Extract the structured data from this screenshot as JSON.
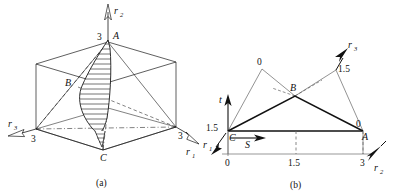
{
  "figure": {
    "panels": [
      {
        "id": "a",
        "caption": "(a)",
        "description": "Cube with hatched lens-shaped surface through points A, B, C",
        "axes": [
          {
            "name": "r2",
            "label": "r",
            "subscript": "2",
            "direction": "up",
            "tick_value": "3"
          },
          {
            "name": "r3",
            "label": "r",
            "subscript": "3",
            "direction": "down-left",
            "tick_value": "3"
          },
          {
            "name": "r1",
            "label": "r",
            "subscript": "1",
            "direction": "down-right",
            "tick_value": "3"
          }
        ],
        "points": [
          {
            "name": "A",
            "label": "A",
            "value": "3"
          },
          {
            "name": "B",
            "label": "B",
            "value": ""
          },
          {
            "name": "C",
            "label": "C",
            "value": ""
          }
        ]
      },
      {
        "id": "b",
        "caption": "(b)",
        "description": "Plane triangle C-B-A with t and S axes",
        "axes": [
          {
            "name": "t",
            "label": "t",
            "subscript": "",
            "direction": "up"
          },
          {
            "name": "S",
            "label": "S",
            "subscript": "",
            "direction": "right"
          },
          {
            "name": "r1",
            "label": "r",
            "subscript": "1",
            "direction": "down-left"
          },
          {
            "name": "r2",
            "label": "r",
            "subscript": "2",
            "direction": "down-right"
          },
          {
            "name": "r3",
            "label": "r",
            "subscript": "3",
            "direction": "up-right"
          }
        ],
        "points": [
          {
            "name": "C",
            "label": "C",
            "value": "1.5"
          },
          {
            "name": "B",
            "label": "B",
            "value": ""
          },
          {
            "name": "A",
            "label": "A",
            "value": "0"
          }
        ],
        "apex_labels": [
          {
            "name": "left-apex",
            "value": "0"
          },
          {
            "name": "right-apex",
            "value": "1.5"
          }
        ],
        "scale_ticks": [
          "0",
          "1.5",
          "3"
        ]
      }
    ]
  },
  "colors": {
    "stroke": "#1a1a1a",
    "light_stroke": "#5a5a5a",
    "hatch": "#2a2a2a",
    "background": "#ffffff"
  }
}
